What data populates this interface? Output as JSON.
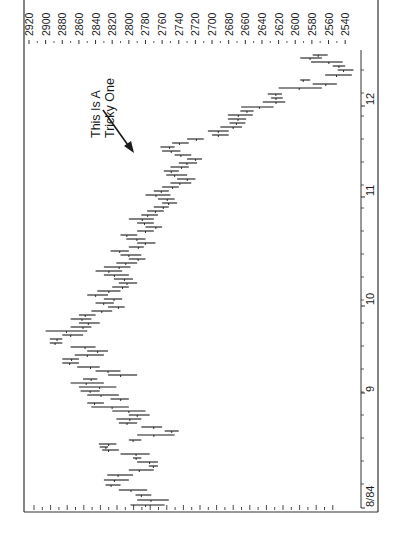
{
  "chart_data": {
    "type": "bar",
    "subtype": "high-low price bars (chart printed rotated 90 degrees clockwise)",
    "title": "",
    "annotation": {
      "lines": [
        "This Is A",
        "Tricky One"
      ],
      "arrow_target": {
        "date": "late 11/84",
        "price": 2775
      }
    },
    "price_axis": {
      "position": "top (rotated)",
      "ticks": [
        2920,
        2900,
        2880,
        2860,
        2840,
        2820,
        2800,
        2780,
        2760,
        2740,
        2720,
        2700,
        2680,
        2660,
        2640,
        2620,
        2600,
        2580,
        2560,
        2540
      ],
      "range": [
        2540,
        2920
      ],
      "minor_tick_step": 10
    },
    "time_axis": {
      "position": "right (rotated)",
      "labels": [
        "8/84",
        "9",
        "10",
        "11",
        "12"
      ],
      "label_y": [
        507,
        392,
        305,
        196,
        105
      ]
    },
    "colors": {
      "line": "#1a1a1a",
      "background": "#ffffff",
      "frame": "#333333"
    },
    "series": [
      {
        "name": "daily high-low range",
        "bars_y_high_low": [
          [
            505,
            2798,
            2757
          ],
          [
            500,
            2790,
            2752
          ],
          [
            495,
            2773,
            2792
          ],
          [
            490,
            2812,
            2778
          ],
          [
            485,
            2828,
            2810
          ],
          [
            480,
            2830,
            2800
          ],
          [
            475,
            2826,
            2795
          ],
          [
            470,
            2800,
            2770
          ],
          [
            466,
            2776,
            2765
          ],
          [
            462,
            2790,
            2765
          ],
          [
            458,
            2795,
            2785
          ],
          [
            454,
            2810,
            2775
          ],
          [
            450,
            2832,
            2812
          ],
          [
            447,
            2835,
            2825
          ],
          [
            444,
            2836,
            2815
          ],
          [
            440,
            2800,
            2785
          ],
          [
            435,
            2790,
            2745
          ],
          [
            431,
            2757,
            2740
          ],
          [
            427,
            2785,
            2760
          ],
          [
            423,
            2812,
            2790
          ],
          [
            419,
            2815,
            2785
          ],
          [
            415,
            2800,
            2775
          ],
          [
            411,
            2820,
            2780
          ],
          [
            407,
            2845,
            2800
          ],
          [
            403,
            2850,
            2830
          ],
          [
            399,
            2822,
            2800
          ],
          [
            395,
            2850,
            2812
          ],
          [
            391,
            2858,
            2835
          ],
          [
            387,
            2860,
            2815
          ],
          [
            383,
            2870,
            2830
          ],
          [
            379,
            2855,
            2838
          ],
          [
            375,
            2825,
            2790
          ],
          [
            371,
            2840,
            2810
          ],
          [
            367,
            2862,
            2835
          ],
          [
            363,
            2880,
            2860
          ],
          [
            359,
            2880,
            2860
          ],
          [
            355,
            2865,
            2830
          ],
          [
            351,
            2850,
            2825
          ],
          [
            347,
            2870,
            2840
          ],
          [
            343,
            2895,
            2880
          ],
          [
            339,
            2895,
            2880
          ],
          [
            335,
            2880,
            2855
          ],
          [
            331,
            2900,
            2850
          ],
          [
            327,
            2870,
            2845
          ],
          [
            323,
            2860,
            2835
          ],
          [
            319,
            2870,
            2845
          ],
          [
            315,
            2860,
            2840
          ],
          [
            311,
            2845,
            2820
          ],
          [
            307,
            2825,
            2805
          ],
          [
            303,
            2840,
            2818
          ],
          [
            299,
            2830,
            2808
          ],
          [
            295,
            2850,
            2825
          ],
          [
            291,
            2838,
            2810
          ],
          [
            287,
            2820,
            2800
          ],
          [
            283,
            2812,
            2790
          ],
          [
            279,
            2818,
            2795
          ],
          [
            275,
            2830,
            2800
          ],
          [
            271,
            2840,
            2808
          ],
          [
            267,
            2830,
            2798
          ],
          [
            263,
            2815,
            2790
          ],
          [
            259,
            2800,
            2780
          ],
          [
            255,
            2810,
            2785
          ],
          [
            251,
            2822,
            2800
          ],
          [
            247,
            2800,
            2782
          ],
          [
            243,
            2790,
            2768
          ],
          [
            239,
            2803,
            2780
          ],
          [
            235,
            2810,
            2790
          ],
          [
            231,
            2790,
            2770
          ],
          [
            227,
            2780,
            2760
          ],
          [
            223,
            2790,
            2770
          ],
          [
            219,
            2800,
            2770
          ],
          [
            215,
            2785,
            2765
          ],
          [
            211,
            2778,
            2758
          ],
          [
            207,
            2770,
            2752
          ],
          [
            203,
            2760,
            2742
          ],
          [
            199,
            2765,
            2745
          ],
          [
            195,
            2780,
            2750
          ],
          [
            191,
            2770,
            2752
          ],
          [
            187,
            2760,
            2740
          ],
          [
            183,
            2750,
            2725
          ],
          [
            179,
            2742,
            2720
          ],
          [
            175,
            2755,
            2730
          ],
          [
            171,
            2758,
            2740
          ],
          [
            167,
            2750,
            2728
          ],
          [
            163,
            2740,
            2718
          ],
          [
            159,
            2730,
            2712
          ],
          [
            155,
            2745,
            2725
          ],
          [
            151,
            2760,
            2738
          ],
          [
            147,
            2762,
            2745
          ],
          [
            143,
            2748,
            2728
          ],
          [
            139,
            2730,
            2710
          ],
          [
            135,
            2700,
            2680
          ],
          [
            131,
            2705,
            2680
          ],
          [
            127,
            2690,
            2664
          ],
          [
            123,
            2679,
            2660
          ],
          [
            119,
            2681,
            2659
          ],
          [
            115,
            2681,
            2651
          ],
          [
            111,
            2666,
            2650
          ],
          [
            107,
            2665,
            2626
          ],
          [
            102,
            2639,
            2612
          ],
          [
            98,
            2629,
            2615
          ],
          [
            94,
            2633,
            2616
          ],
          [
            88,
            2620,
            2568
          ],
          [
            84,
            2579,
            2550
          ],
          [
            80,
            2594,
            2582
          ],
          [
            75,
            2564,
            2532
          ],
          [
            70,
            2549,
            2530
          ],
          [
            66,
            2555,
            2540
          ],
          [
            62,
            2581,
            2543
          ],
          [
            58,
            2594,
            2568
          ],
          [
            55,
            2579,
            2561
          ]
        ]
      }
    ]
  }
}
